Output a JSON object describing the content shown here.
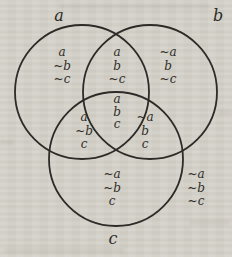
{
  "diagram": {
    "type": "venn-3",
    "background_color": "#d5d2ca",
    "stroke_color": "#2d2b27",
    "text_color": "#2f2d29",
    "circle_labels": {
      "a": "a",
      "b": "b",
      "c": "c"
    },
    "regions": {
      "a_only": {
        "lines": [
          "a",
          "~b",
          "~c"
        ]
      },
      "a_and_b": {
        "lines": [
          "a",
          "b",
          "~c"
        ]
      },
      "b_only": {
        "lines": [
          "~a",
          "b",
          "~c"
        ]
      },
      "a_and_c": {
        "lines": [
          "a",
          "~b",
          "c"
        ]
      },
      "a_b_c": {
        "lines": [
          "a",
          "b",
          "c"
        ]
      },
      "b_and_c": {
        "lines": [
          "~a",
          "b",
          "c"
        ]
      },
      "c_only": {
        "lines": [
          "~a",
          "~b",
          "c"
        ]
      },
      "outside": {
        "lines": [
          "~a",
          "~b",
          "~c"
        ]
      }
    }
  }
}
